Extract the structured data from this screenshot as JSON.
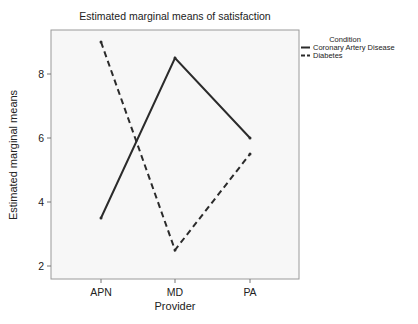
{
  "chart_data": {
    "type": "line",
    "title": "Estimated marginal means of satisfaction",
    "xlabel": "Provider",
    "ylabel": "Estimated marginal means",
    "categories": [
      "APN",
      "MD",
      "PA"
    ],
    "series": [
      {
        "name": "Coronary Artery Disease",
        "style": "solid",
        "values": [
          3.5,
          8.5,
          6.0
        ]
      },
      {
        "name": "Diabetes",
        "style": "dashed",
        "values": [
          9.0,
          2.5,
          5.5
        ]
      }
    ],
    "yticks": [
      2,
      4,
      6,
      8
    ],
    "ylim": [
      1.6,
      9.4
    ],
    "grid": false,
    "legend": {
      "title": "Condition",
      "position": "right-top"
    }
  },
  "colors": {
    "line": "#2b2b2b",
    "plot_background": "#f7f7f7",
    "plot_border": "#9a9a9a"
  }
}
